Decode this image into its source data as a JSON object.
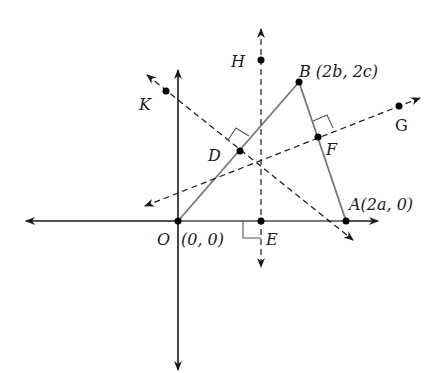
{
  "diagram": {
    "colors": {
      "axis": "#1a1a1a",
      "triangle": "#777777",
      "dashed": "#1a1a1a",
      "point": "#000000"
    },
    "points": [
      {
        "id": "O",
        "label": "O",
        "coord_label": "(0, 0)",
        "x": 178,
        "y": 221
      },
      {
        "id": "A",
        "label": "A",
        "coord_label": "(2a, 0)",
        "x": 346,
        "y": 221
      },
      {
        "id": "B",
        "label": "B",
        "coord_label": "(2b, 2c)",
        "x": 299,
        "y": 82
      },
      {
        "id": "D",
        "label": "D",
        "coord_label": "",
        "x": 240,
        "y": 151
      },
      {
        "id": "E",
        "label": "E",
        "coord_label": "",
        "x": 261,
        "y": 221
      },
      {
        "id": "F",
        "label": "F",
        "coord_label": "",
        "x": 318,
        "y": 137
      },
      {
        "id": "G",
        "label": "G",
        "coord_label": "",
        "x": 399,
        "y": 106
      },
      {
        "id": "H",
        "label": "H",
        "coord_label": "",
        "x": 261,
        "y": 60
      },
      {
        "id": "K",
        "label": "K",
        "coord_label": "",
        "x": 166,
        "y": 91
      }
    ],
    "labels": {
      "O": "O",
      "O_coord": "(0, 0)",
      "A": "A(2a, 0)",
      "B": "B (2b, 2c)",
      "D": "D",
      "E": "E",
      "F": "F",
      "G": "G",
      "H": "H",
      "K": "K"
    }
  }
}
